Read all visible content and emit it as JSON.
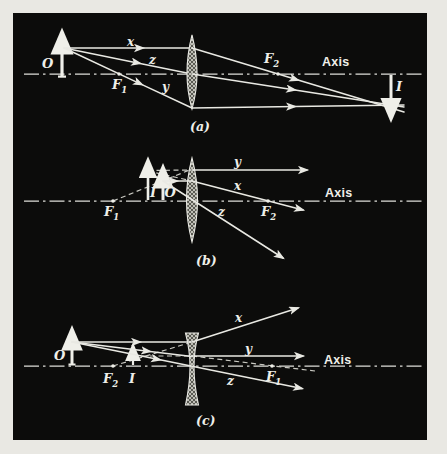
{
  "figure": {
    "type": "optics-lens-ray-diagram",
    "colors": {
      "page_background": "#e9e8e3",
      "figure_background": "#0c0c0b",
      "ink": "#e9e9e3"
    }
  },
  "panels": {
    "a": {
      "caption": "(a)",
      "object": "O",
      "image": "I",
      "ray_x": "x",
      "ray_y": "y",
      "ray_z": "z",
      "axis": "Axis",
      "f1": {
        "base": "F",
        "sub": "1"
      },
      "f2": {
        "base": "F",
        "sub": "2"
      }
    },
    "b": {
      "caption": "(b)",
      "object": "O",
      "image": "I",
      "ray_x": "x",
      "ray_y": "y",
      "ray_z": "z",
      "axis": "Axis",
      "f1": {
        "base": "F",
        "sub": "1"
      },
      "f2": {
        "base": "F",
        "sub": "2"
      }
    },
    "c": {
      "caption": "(c)",
      "object": "O",
      "image": "I",
      "ray_x": "x",
      "ray_y": "y",
      "ray_z": "z",
      "axis": "Axis",
      "f1": {
        "base": "F",
        "sub": "1"
      },
      "f2": {
        "base": "F",
        "sub": "2"
      }
    }
  }
}
